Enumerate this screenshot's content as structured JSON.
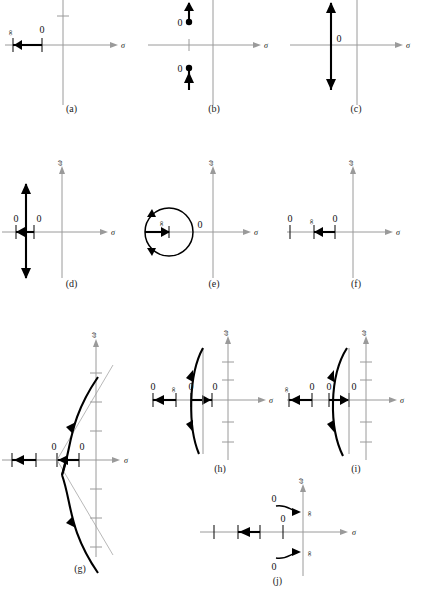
{
  "figure": {
    "axis_labels": {
      "real": "σ",
      "imag": "ω"
    },
    "symbols": {
      "zero": "0",
      "infinity": "∞"
    },
    "colors": {
      "axis": "#9a9a9a",
      "locus": "#000000",
      "asymptote": "#9a9a9a"
    }
  },
  "panels": [
    {
      "caption": "(a)",
      "sigma_label": "σ",
      "omega_label": "",
      "marks": [
        {
          "text": "∞",
          "rotated": true
        },
        {
          "text": "0",
          "rotated": false
        }
      ]
    },
    {
      "caption": "(b)",
      "sigma_label": "σ",
      "omega_label": "",
      "marks": [
        {
          "text": "0",
          "rotated": false
        },
        {
          "text": "0",
          "rotated": false
        }
      ]
    },
    {
      "caption": "(c)",
      "sigma_label": "σ",
      "omega_label": "",
      "marks": [
        {
          "text": "0",
          "rotated": false
        }
      ]
    },
    {
      "caption": "(d)",
      "sigma_label": "σ",
      "omega_label": "ω",
      "marks": [
        {
          "text": "0",
          "rotated": false
        },
        {
          "text": "0",
          "rotated": false
        }
      ]
    },
    {
      "caption": "(e)",
      "sigma_label": "σ",
      "omega_label": "ω",
      "marks": [
        {
          "text": "∞",
          "rotated": true
        },
        {
          "text": "0",
          "rotated": false
        }
      ]
    },
    {
      "caption": "(f)",
      "sigma_label": "σ",
      "omega_label": "ω",
      "marks": [
        {
          "text": "0",
          "rotated": false
        },
        {
          "text": "∞",
          "rotated": true
        },
        {
          "text": "0",
          "rotated": false
        }
      ]
    },
    {
      "caption": "(g)",
      "sigma_label": "σ",
      "omega_label": "ω",
      "marks": [
        {
          "text": "0",
          "rotated": false
        },
        {
          "text": "0",
          "rotated": false
        }
      ]
    },
    {
      "caption": "(h)",
      "sigma_label": "σ",
      "omega_label": "ω",
      "marks": [
        {
          "text": "0",
          "rotated": false
        },
        {
          "text": "∞",
          "rotated": true
        },
        {
          "text": "0",
          "rotated": false
        },
        {
          "text": "0",
          "rotated": false
        }
      ]
    },
    {
      "caption": "(i)",
      "sigma_label": "σ",
      "omega_label": "ω",
      "marks": [
        {
          "text": "∞",
          "rotated": true
        },
        {
          "text": "0",
          "rotated": false
        },
        {
          "text": "0",
          "rotated": false
        },
        {
          "text": "0",
          "rotated": false
        }
      ]
    },
    {
      "caption": "(j)",
      "sigma_label": "σ",
      "omega_label": "ω",
      "marks": [
        {
          "text": "0",
          "rotated": false
        },
        {
          "text": "∞",
          "rotated": true
        },
        {
          "text": "0",
          "rotated": false
        },
        {
          "text": "0",
          "rotated": false
        },
        {
          "text": "∞",
          "rotated": true
        }
      ]
    }
  ]
}
